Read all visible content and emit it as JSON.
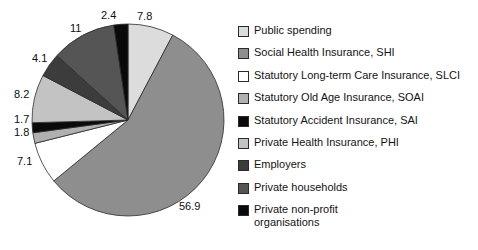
{
  "chart_data": {
    "type": "pie",
    "title": "",
    "subtitle": "",
    "xlabel": "",
    "ylabel": "",
    "grid": false,
    "legend_position": "right",
    "units": "percent",
    "start_angle_deg": 0,
    "direction": "clockwise",
    "categories": [
      "Public spending",
      "Social Health Insurance, SHI",
      "Statutory Long-term Care Insurance, SLCI",
      "Statutory Old Age Insurance, SOAI",
      "Statutory Accident Insurance, SAI",
      "Private Health Insurance, PHI",
      "Employers",
      "Private households",
      "Private non-profit organisations"
    ],
    "values": [
      7.8,
      56.9,
      7.1,
      1.8,
      1.7,
      8.2,
      4.1,
      11,
      2.4
    ],
    "labels": [
      "7.8",
      "56.9",
      "7.1",
      "1.8",
      "1.7",
      "8.2",
      "4.1",
      "11",
      "2.4"
    ],
    "colors": [
      "#dcdcdc",
      "#8e8e8e",
      "#ffffff",
      "#b0b0b0",
      "#0a0a0a",
      "#c3c3c3",
      "#3c3c3c",
      "#555555",
      "#0a0a0a"
    ]
  },
  "legend": {
    "items": [
      {
        "label": "Public spending",
        "label_line2": "",
        "color": "#dcdcdc",
        "value": "7.8"
      },
      {
        "label": "Social Health Insurance, SHI",
        "label_line2": "",
        "color": "#8e8e8e",
        "value": "56.9"
      },
      {
        "label": "Statutory Long-term Care Insurance, SLCI",
        "label_line2": "",
        "color": "#ffffff",
        "value": "7.1"
      },
      {
        "label": "Statutory Old Age Insurance, SOAI",
        "label_line2": "",
        "color": "#b0b0b0",
        "value": "1.8"
      },
      {
        "label": "Statutory Accident Insurance, SAI",
        "label_line2": "",
        "color": "#0a0a0a",
        "value": "1.7"
      },
      {
        "label": "Private Health Insurance, PHI",
        "label_line2": "",
        "color": "#c3c3c3",
        "value": "8.2"
      },
      {
        "label": "Employers",
        "label_line2": "",
        "color": "#3c3c3c",
        "value": "4.1"
      },
      {
        "label": "Private households",
        "label_line2": "",
        "color": "#555555",
        "value": "11"
      },
      {
        "label": "Private non-profit",
        "label_line2": "organisations",
        "color": "#0a0a0a",
        "value": "2.4"
      }
    ]
  },
  "slice_labels": [
    {
      "text": "7.8",
      "x": 137,
      "y": 10
    },
    {
      "text": "2.4",
      "x": 101,
      "y": 9
    },
    {
      "text": "11",
      "x": 70,
      "y": 22
    },
    {
      "text": "4.1",
      "x": 32,
      "y": 52
    },
    {
      "text": "8.2",
      "x": 14,
      "y": 88
    },
    {
      "text": "1.7",
      "x": 14,
      "y": 113
    },
    {
      "text": "1.8",
      "x": 14,
      "y": 126
    },
    {
      "text": "7.1",
      "x": 17,
      "y": 155
    },
    {
      "text": "56.9",
      "x": 179,
      "y": 200
    }
  ]
}
